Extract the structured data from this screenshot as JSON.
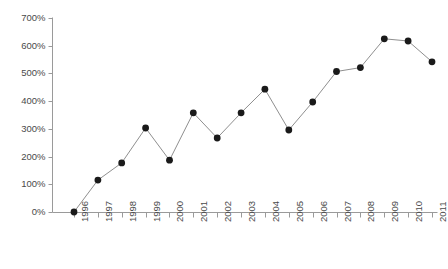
{
  "chart_data": {
    "type": "line",
    "title": "",
    "subtitle": "",
    "xlabel": "",
    "ylabel": "",
    "categories": [
      "1996",
      "1997",
      "1998",
      "1999",
      "2000",
      "2001",
      "2002",
      "2003",
      "2004",
      "2005",
      "2006",
      "2007",
      "2008",
      "2009",
      "2010",
      "2011"
    ],
    "values": [
      0,
      115,
      177,
      303,
      187,
      358,
      267,
      358,
      443,
      296,
      397,
      507,
      521,
      625,
      617,
      542
    ],
    "series": [
      {
        "name": "",
        "values": [
          0,
          115,
          177,
          303,
          187,
          358,
          267,
          358,
          443,
          296,
          397,
          507,
          521,
          625,
          617,
          542
        ]
      }
    ],
    "ylim": [
      0,
      700
    ],
    "ytick_values": [
      0,
      100,
      200,
      300,
      400,
      500,
      600,
      700
    ],
    "ytick_labels": [
      "0%",
      "100%",
      "200%",
      "300%",
      "400%",
      "500%",
      "600%",
      "700%"
    ],
    "xtick_labels": [
      "1996",
      "1997",
      "1998",
      "1999",
      "2000",
      "2001",
      "2002",
      "2003",
      "2004",
      "2005",
      "2006",
      "2007",
      "2008",
      "2009",
      "2010",
      "2011"
    ],
    "grid": false,
    "legend": null,
    "legend_position": "none",
    "marker": "filled-circle",
    "marker_color": "#1a1a1a",
    "line_color": "#8f8f8f",
    "axis_color": "#9a9a9a",
    "tick_label_color": "#4a4a4a",
    "xtick_label_rotation": -90,
    "annotations": []
  },
  "axes": {
    "y_axis_name": "percent-axis",
    "x_axis_name": "year-axis"
  },
  "footer": {
    "smudge_text": ""
  }
}
